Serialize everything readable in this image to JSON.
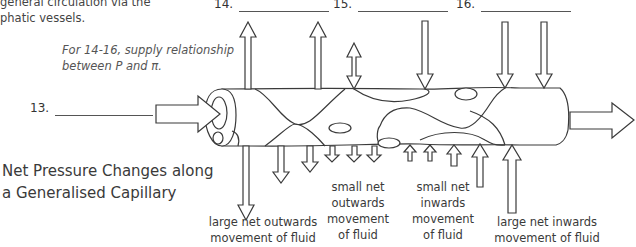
{
  "intro_text": {
    "line1": "general circulation via the",
    "line2": "phatic vessels."
  },
  "instruction": {
    "line1": "For 14-16, supply relationship",
    "line2": "between P and π."
  },
  "blanks": [
    {
      "number": "13.",
      "value": ""
    },
    {
      "number": "14.",
      "value": ""
    },
    {
      "number": "15.",
      "value": ""
    },
    {
      "number": "16.",
      "value": ""
    }
  ],
  "title": {
    "line1": "Net Pressure Changes along",
    "line2": "a Generalised Capillary"
  },
  "captions": [
    {
      "lines": [
        "large net outwards",
        "movement of fluid"
      ]
    },
    {
      "lines": [
        "small net",
        "outwards",
        "movement",
        "of fluid"
      ]
    },
    {
      "lines": [
        "small net",
        "inwards",
        "movement",
        "of fluid"
      ]
    },
    {
      "lines": [
        "large net inwards",
        "movement of fluid"
      ]
    }
  ],
  "diagram": {
    "stroke_color": "#3a3a3a",
    "fill_color": "#ffffff",
    "flow_direction": "left-to-right",
    "icons": [
      "arrow-right-icon",
      "arrow-up-icon",
      "arrow-down-icon",
      "double-arrow-icon"
    ]
  }
}
